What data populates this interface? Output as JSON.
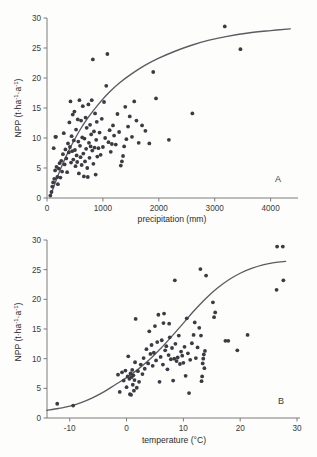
{
  "figure": {
    "background_color": "#fdfdfc",
    "marker_color": "#3b3b42",
    "curve_color": "#5b5b63",
    "axis_color": "#6d6d6d"
  },
  "panels": [
    {
      "id": "A",
      "label": "A",
      "xlabel": "precipitation (mm)",
      "ylabel": "NPP (t·ha⁻¹·a⁻¹)"
    },
    {
      "id": "B",
      "label": "B",
      "xlabel": "temperature (°C)",
      "ylabel": "NPP (t·ha⁻¹·a⁻¹)"
    }
  ],
  "chart_data": [
    {
      "type": "scatter",
      "id": "A",
      "title": "",
      "panel_label": "A",
      "xlabel": "precipitation (mm)",
      "ylabel": "NPP (t·ha⁻¹·a⁻¹)",
      "xlim": [
        0,
        4400
      ],
      "ylim": [
        0,
        30
      ],
      "xticks": [
        0,
        1000,
        2000,
        3000,
        4000
      ],
      "xticklabels": [
        "0",
        "1000",
        "2000",
        "3000",
        "4000"
      ],
      "yticks": [
        0,
        5,
        10,
        15,
        20,
        25,
        30
      ],
      "yticklabels": [
        "0",
        "5",
        "10",
        "15",
        "20",
        "25",
        "30"
      ],
      "grid": false,
      "legend": "none",
      "series": [
        {
          "name": "observations",
          "marker": "filled-circle",
          "points": [
            [
              60,
              0.4
            ],
            [
              80,
              1.0
            ],
            [
              95,
              1.9
            ],
            [
              110,
              2.6
            ],
            [
              120,
              8.3
            ],
            [
              130,
              3.2
            ],
            [
              145,
              4.6
            ],
            [
              150,
              10.2
            ],
            [
              160,
              10.2
            ],
            [
              170,
              5.2
            ],
            [
              185,
              3.5
            ],
            [
              195,
              2.3
            ],
            [
              210,
              4.9
            ],
            [
              225,
              5.8
            ],
            [
              240,
              3.4
            ],
            [
              255,
              6.2
            ],
            [
              270,
              4.4
            ],
            [
              285,
              7.3
            ],
            [
              300,
              10.8
            ],
            [
              315,
              5.6
            ],
            [
              330,
              8.1
            ],
            [
              345,
              6.6
            ],
            [
              360,
              4.3
            ],
            [
              375,
              9.1
            ],
            [
              390,
              7.6
            ],
            [
              400,
              12.6
            ],
            [
              410,
              8.5
            ],
            [
              420,
              16.1
            ],
            [
              430,
              5.9
            ],
            [
              440,
              10.3
            ],
            [
              450,
              7.8
            ],
            [
              460,
              13.9
            ],
            [
              470,
              6.4
            ],
            [
              480,
              9.6
            ],
            [
              490,
              14.4
            ],
            [
              500,
              8.0
            ],
            [
              510,
              5.3
            ],
            [
              520,
              11.4
            ],
            [
              530,
              7.1
            ],
            [
              540,
              6.0
            ],
            [
              550,
              13.1
            ],
            [
              560,
              9.4
            ],
            [
              570,
              4.1
            ],
            [
              580,
              16.3
            ],
            [
              590,
              8.7
            ],
            [
              600,
              6.8
            ],
            [
              610,
              12.9
            ],
            [
              620,
              5.5
            ],
            [
              630,
              10.1
            ],
            [
              640,
              15.3
            ],
            [
              650,
              7.4
            ],
            [
              660,
              3.6
            ],
            [
              670,
              9.9
            ],
            [
              680,
              6.1
            ],
            [
              690,
              13.4
            ],
            [
              700,
              8.2
            ],
            [
              710,
              11.7
            ],
            [
              720,
              5.0
            ],
            [
              730,
              3.5
            ],
            [
              740,
              15.6
            ],
            [
              750,
              9.2
            ],
            [
              760,
              6.7
            ],
            [
              770,
              12.2
            ],
            [
              780,
              8.6
            ],
            [
              790,
              10.6
            ],
            [
              800,
              16.3
            ],
            [
              810,
              7.9
            ],
            [
              820,
              23.1
            ],
            [
              830,
              5.7
            ],
            [
              840,
              11.1
            ],
            [
              850,
              8.4
            ],
            [
              860,
              14.1
            ],
            [
              870,
              3.9
            ],
            [
              880,
              9.7
            ],
            [
              890,
              12.7
            ],
            [
              900,
              6.9
            ],
            [
              920,
              8.3
            ],
            [
              940,
              10.9
            ],
            [
              960,
              7.2
            ],
            [
              980,
              13.2
            ],
            [
              1000,
              8.5
            ],
            [
              1020,
              16.0
            ],
            [
              1040,
              10.0
            ],
            [
              1060,
              18.7
            ],
            [
              1080,
              24.0
            ],
            [
              1100,
              9.3
            ],
            [
              1120,
              11.3
            ],
            [
              1140,
              7.7
            ],
            [
              1160,
              9.0
            ],
            [
              1180,
              12.1
            ],
            [
              1200,
              10.4
            ],
            [
              1230,
              8.9
            ],
            [
              1260,
              14.0
            ],
            [
              1290,
              11.0
            ],
            [
              1320,
              5.4
            ],
            [
              1340,
              6.1
            ],
            [
              1360,
              7.0
            ],
            [
              1380,
              8.6
            ],
            [
              1400,
              15.2
            ],
            [
              1420,
              9.8
            ],
            [
              1450,
              11.9
            ],
            [
              1480,
              13.6
            ],
            [
              1520,
              10.2
            ],
            [
              1560,
              16.1
            ],
            [
              1600,
              12.9
            ],
            [
              1640,
              9.2
            ],
            [
              1700,
              12.1
            ],
            [
              1760,
              11.2
            ],
            [
              1830,
              9.1
            ],
            [
              1900,
              21.0
            ],
            [
              1950,
              16.6
            ],
            [
              2180,
              9.7
            ],
            [
              2600,
              14.1
            ],
            [
              3180,
              28.6
            ],
            [
              3460,
              24.8
            ]
          ]
        }
      ],
      "fit_curve": {
        "name": "fitted saturating curve",
        "description": "monotonic saturating fit rising steeply to ~1000 mm then leveling near 28",
        "points": [
          [
            60,
            0.3
          ],
          [
            150,
            2.6
          ],
          [
            250,
            5.0
          ],
          [
            350,
            7.1
          ],
          [
            450,
            9.0
          ],
          [
            600,
            11.5
          ],
          [
            750,
            13.6
          ],
          [
            900,
            15.4
          ],
          [
            1100,
            17.5
          ],
          [
            1300,
            19.2
          ],
          [
            1500,
            20.6
          ],
          [
            1750,
            22.1
          ],
          [
            2000,
            23.3
          ],
          [
            2300,
            24.5
          ],
          [
            2600,
            25.5
          ],
          [
            2900,
            26.3
          ],
          [
            3200,
            26.9
          ],
          [
            3600,
            27.5
          ],
          [
            4000,
            27.9
          ],
          [
            4350,
            28.2
          ]
        ]
      }
    },
    {
      "type": "scatter",
      "id": "B",
      "title": "",
      "panel_label": "B",
      "xlabel": "temperature (°C)",
      "ylabel": "NPP (t·ha⁻¹·a⁻¹)",
      "xlim": [
        -14,
        30
      ],
      "ylim": [
        0,
        30
      ],
      "xticks": [
        -10,
        0,
        10,
        20,
        30
      ],
      "xticklabels": [
        "-10",
        "0",
        "10",
        "20",
        "30"
      ],
      "yticks": [
        0,
        5,
        10,
        15,
        20,
        25,
        30
      ],
      "yticklabels": [
        "0",
        "5",
        "10",
        "15",
        "20",
        "25",
        "30"
      ],
      "grid": false,
      "legend": "none",
      "series": [
        {
          "name": "observations",
          "marker": "filled-circle",
          "points": [
            [
              -12.2,
              2.4
            ],
            [
              -9.4,
              2.1
            ],
            [
              -1.5,
              7.3
            ],
            [
              -1.2,
              4.4
            ],
            [
              -0.8,
              7.7
            ],
            [
              -0.5,
              6.3
            ],
            [
              -0.2,
              8.0
            ],
            [
              0.0,
              5.2
            ],
            [
              0.2,
              7.0
            ],
            [
              0.3,
              10.4
            ],
            [
              0.5,
              6.6
            ],
            [
              0.6,
              4.0
            ],
            [
              0.7,
              7.5
            ],
            [
              0.8,
              3.9
            ],
            [
              0.9,
              6.9
            ],
            [
              1.0,
              8.1
            ],
            [
              1.1,
              5.6
            ],
            [
              1.2,
              7.2
            ],
            [
              1.3,
              4.6
            ],
            [
              1.4,
              6.4
            ],
            [
              1.5,
              9.4
            ],
            [
              1.6,
              16.7
            ],
            [
              1.8,
              5.1
            ],
            [
              2.0,
              7.9
            ],
            [
              2.2,
              6.1
            ],
            [
              2.5,
              9.0
            ],
            [
              2.8,
              7.4
            ],
            [
              3.0,
              10.1
            ],
            [
              3.2,
              8.3
            ],
            [
              3.5,
              11.6
            ],
            [
              3.8,
              9.2
            ],
            [
              4.0,
              14.6
            ],
            [
              4.2,
              10.8
            ],
            [
              4.4,
              12.3
            ],
            [
              4.6,
              8.8
            ],
            [
              4.8,
              11.0
            ],
            [
              5.0,
              15.5
            ],
            [
              5.2,
              9.7
            ],
            [
              5.4,
              12.8
            ],
            [
              5.6,
              17.4
            ],
            [
              5.8,
              6.1
            ],
            [
              6.0,
              10.3
            ],
            [
              6.2,
              13.1
            ],
            [
              6.4,
              9.0
            ],
            [
              6.5,
              16.0
            ],
            [
              6.6,
              17.6
            ],
            [
              6.8,
              11.4
            ],
            [
              7.0,
              12.1
            ],
            [
              7.2,
              8.2
            ],
            [
              7.4,
              10.6
            ],
            [
              7.5,
              15.9
            ],
            [
              7.6,
              13.6
            ],
            [
              7.8,
              9.9
            ],
            [
              8.0,
              11.8
            ],
            [
              8.2,
              6.3
            ],
            [
              8.4,
              10.0
            ],
            [
              8.5,
              23.2
            ],
            [
              8.6,
              12.5
            ],
            [
              8.8,
              9.6
            ],
            [
              9.0,
              10.2
            ],
            [
              9.2,
              13.9
            ],
            [
              9.4,
              9.1
            ],
            [
              9.6,
              11.2
            ],
            [
              9.8,
              10.5
            ],
            [
              10.0,
              9.3
            ],
            [
              10.2,
              12.0
            ],
            [
              10.4,
              7.1
            ],
            [
              10.6,
              16.8
            ],
            [
              10.8,
              10.9
            ],
            [
              11.0,
              4.2
            ],
            [
              11.2,
              9.8
            ],
            [
              11.5,
              12.6
            ],
            [
              11.8,
              14.0
            ],
            [
              12.0,
              16.1
            ],
            [
              12.2,
              10.1
            ],
            [
              12.5,
              11.9
            ],
            [
              12.8,
              15.2
            ],
            [
              13.0,
              25.1
            ],
            [
              13.1,
              13.9
            ],
            [
              13.2,
              6.2
            ],
            [
              13.3,
              7.0
            ],
            [
              13.4,
              9.2
            ],
            [
              13.5,
              10.0
            ],
            [
              13.6,
              10.7
            ],
            [
              13.7,
              8.4
            ],
            [
              13.8,
              11.3
            ],
            [
              14.0,
              24.0
            ],
            [
              15.2,
              19.5
            ],
            [
              15.4,
              17.0
            ],
            [
              15.6,
              17.8
            ],
            [
              17.4,
              13.0
            ],
            [
              17.9,
              13.0
            ],
            [
              19.5,
              11.4
            ],
            [
              21.3,
              14.0
            ],
            [
              26.4,
              21.6
            ],
            [
              26.5,
              28.9
            ],
            [
              27.5,
              28.9
            ],
            [
              27.6,
              23.2
            ]
          ]
        }
      ],
      "fit_curve": {
        "name": "fitted sigmoid curve",
        "description": "S-shaped fit rising from ~1.3 at -14 C to ~26.3 at 28 C",
        "points": [
          [
            -14,
            1.3
          ],
          [
            -12,
            1.6
          ],
          [
            -10,
            2.0
          ],
          [
            -8,
            2.6
          ],
          [
            -6,
            3.4
          ],
          [
            -4,
            4.4
          ],
          [
            -2,
            5.6
          ],
          [
            0,
            6.8
          ],
          [
            2,
            8.2
          ],
          [
            4,
            9.8
          ],
          [
            6,
            11.7
          ],
          [
            8,
            13.8
          ],
          [
            10,
            16.0
          ],
          [
            12,
            18.2
          ],
          [
            14,
            20.2
          ],
          [
            16,
            21.9
          ],
          [
            18,
            23.3
          ],
          [
            20,
            24.4
          ],
          [
            22,
            25.2
          ],
          [
            24,
            25.8
          ],
          [
            26,
            26.2
          ],
          [
            28,
            26.4
          ]
        ]
      }
    }
  ]
}
